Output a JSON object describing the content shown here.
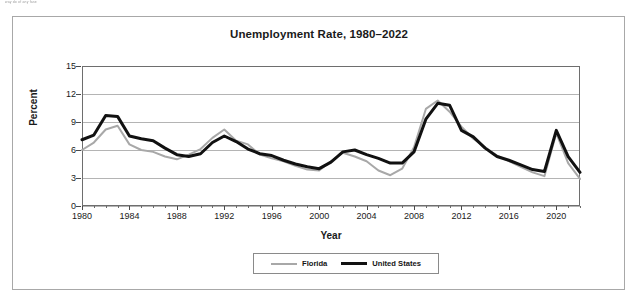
{
  "scan_artifact": {
    "text": "way do of any fase"
  },
  "figure": {
    "title": "Unemployment Rate, 1980–2022",
    "x_axis_title": "Year",
    "y_axis_title": "Percent"
  },
  "legend": {
    "position": "bottom-center",
    "entries": [
      {
        "label": "Florida",
        "color": "#a8a8a8"
      },
      {
        "label": "United States",
        "color": "#111111"
      }
    ]
  },
  "colors": {
    "florida": "#a8a8a8",
    "united_states": "#111111",
    "gridline": "#b4b4b4",
    "axis": "#6e6e6e",
    "frame": "#a8a8a8",
    "text": "#1a1a1a"
  },
  "chart_data": {
    "type": "line",
    "title": "Unemployment Rate, 1980–2022",
    "xlabel": "Year",
    "ylabel": "Percent",
    "xlim": [
      1980,
      2022
    ],
    "ylim": [
      0,
      15
    ],
    "yticks": [
      0,
      3,
      6,
      9,
      12,
      15
    ],
    "xticks": [
      1980,
      1984,
      1988,
      1992,
      1996,
      2000,
      2004,
      2008,
      2012,
      2016,
      2020
    ],
    "x_minor_tick_interval": 1,
    "grid": true,
    "legend_position": "bottom-center",
    "x": [
      1980,
      1981,
      1982,
      1983,
      1984,
      1985,
      1986,
      1987,
      1988,
      1989,
      1990,
      1991,
      1992,
      1993,
      1994,
      1995,
      1996,
      1997,
      1998,
      1999,
      2000,
      2001,
      2002,
      2003,
      2004,
      2005,
      2006,
      2007,
      2008,
      2009,
      2010,
      2011,
      2012,
      2013,
      2014,
      2015,
      2016,
      2017,
      2018,
      2019,
      2020,
      2021,
      2022
    ],
    "series": [
      {
        "name": "Florida",
        "color": "#a8a8a8",
        "line_width": 2,
        "values": [
          6.0,
          6.8,
          8.2,
          8.6,
          6.6,
          6.0,
          5.8,
          5.3,
          5.0,
          5.5,
          6.1,
          7.3,
          8.2,
          7.0,
          6.6,
          5.5,
          5.1,
          4.8,
          4.3,
          3.9,
          3.8,
          4.8,
          5.7,
          5.3,
          4.8,
          3.8,
          3.3,
          4.0,
          6.3,
          10.4,
          11.3,
          10.1,
          8.5,
          7.2,
          6.3,
          5.4,
          4.8,
          4.2,
          3.6,
          3.2,
          7.8,
          4.6,
          2.9
        ]
      },
      {
        "name": "United States",
        "color": "#111111",
        "line_width": 3,
        "values": [
          7.1,
          7.6,
          9.7,
          9.6,
          7.5,
          7.2,
          7.0,
          6.2,
          5.5,
          5.3,
          5.6,
          6.8,
          7.5,
          6.9,
          6.1,
          5.6,
          5.4,
          4.9,
          4.5,
          4.2,
          4.0,
          4.7,
          5.8,
          6.0,
          5.5,
          5.1,
          4.6,
          4.6,
          5.8,
          9.3,
          11.0,
          10.8,
          8.1,
          7.4,
          6.2,
          5.3,
          4.9,
          4.4,
          3.9,
          3.7,
          8.1,
          5.3,
          3.6
        ]
      }
    ]
  }
}
